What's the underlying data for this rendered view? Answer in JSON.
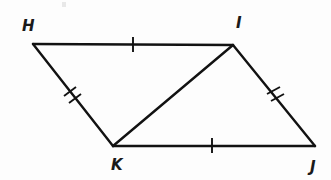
{
  "figure": {
    "kind": "geometry-diagram",
    "shape_name": "quadrilateral HIJK with diagonal KI",
    "stroke_color": "#121212",
    "background_color": "#fdfdfd",
    "label_color": "#1a1a1a",
    "vertices": [
      {
        "id": "H",
        "label": "H",
        "x": 33,
        "y": 44,
        "label_x": 22,
        "label_y": 31
      },
      {
        "id": "I",
        "label": "I",
        "x": 233,
        "y": 45,
        "label_x": 236,
        "label_y": 28
      },
      {
        "id": "K",
        "label": "K",
        "x": 113,
        "y": 146,
        "label_x": 111,
        "label_y": 170
      },
      {
        "id": "J",
        "label": "J",
        "x": 315,
        "y": 146,
        "label_x": 310,
        "label_y": 172
      }
    ],
    "edges": [
      {
        "id": "HI",
        "from": "H",
        "to": "I",
        "x1": 33,
        "y1": 44,
        "x2": 233,
        "y2": 45,
        "ticks": 1
      },
      {
        "id": "IJ",
        "from": "I",
        "to": "J",
        "x1": 233,
        "y1": 45,
        "x2": 315,
        "y2": 146,
        "ticks": 2
      },
      {
        "id": "KJ",
        "from": "K",
        "to": "J",
        "x1": 113,
        "y1": 146,
        "x2": 315,
        "y2": 146,
        "ticks": 1
      },
      {
        "id": "HK",
        "from": "H",
        "to": "K",
        "x1": 33,
        "y1": 44,
        "x2": 113,
        "y2": 146,
        "ticks": 2
      }
    ],
    "diagonals": [
      {
        "id": "KI",
        "from": "K",
        "to": "I",
        "x1": 113,
        "y1": 146,
        "x2": 233,
        "y2": 45,
        "ticks": 0
      }
    ],
    "tick_marks": [
      {
        "id": "tick-HI-1",
        "edge": "HI",
        "x1": 133,
        "y1": 37,
        "x2": 133,
        "y2": 52
      },
      {
        "id": "tick-KJ-1",
        "edge": "KJ",
        "x1": 212,
        "y1": 138,
        "x2": 212,
        "y2": 153
      },
      {
        "id": "tick-HK-1",
        "edge": "HK",
        "x1": 64,
        "y1": 96,
        "x2": 76,
        "y2": 87
      },
      {
        "id": "tick-HK-2",
        "edge": "HK",
        "x1": 69,
        "y1": 103,
        "x2": 81,
        "y2": 94
      },
      {
        "id": "tick-IJ-1",
        "edge": "IJ",
        "x1": 267,
        "y1": 94,
        "x2": 280,
        "y2": 87
      },
      {
        "id": "tick-IJ-2",
        "edge": "IJ",
        "x1": 271,
        "y1": 101,
        "x2": 284,
        "y2": 94
      }
    ],
    "specks": [
      {
        "id": "speck-top-left",
        "x": 62,
        "y": 2,
        "w": 4,
        "h": 5
      }
    ]
  }
}
